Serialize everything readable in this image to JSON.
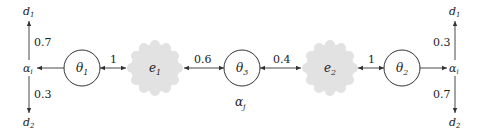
{
  "diagram": {
    "nodes": {
      "theta1": {
        "label": "θ",
        "sub": "1"
      },
      "theta2": {
        "label": "θ",
        "sub": "2"
      },
      "theta3": {
        "label": "θ",
        "sub": "3"
      },
      "e1": {
        "label": "e",
        "sub": "1"
      },
      "e2": {
        "label": "e",
        "sub": "2"
      }
    },
    "left": {
      "alpha": {
        "label": "α",
        "sub": "i"
      },
      "d1": {
        "label": "d",
        "sub": "1"
      },
      "d2": {
        "label": "d",
        "sub": "2"
      },
      "p_up": "0.7",
      "p_down": "0.3"
    },
    "right": {
      "alpha": {
        "label": "α",
        "sub": "i"
      },
      "d1": {
        "label": "d",
        "sub": "1"
      },
      "d2": {
        "label": "d",
        "sub": "2"
      },
      "p_up": "0.3",
      "p_down": "0.7"
    },
    "center_label": {
      "label": "α",
      "sub": "j"
    },
    "edges": {
      "theta1_e1": "1",
      "e1_theta3": "0.6",
      "theta3_e2": "0.4",
      "e2_theta2": "1"
    },
    "colors": {
      "cloud": "#e2e2e2",
      "stroke": "#333333"
    }
  }
}
